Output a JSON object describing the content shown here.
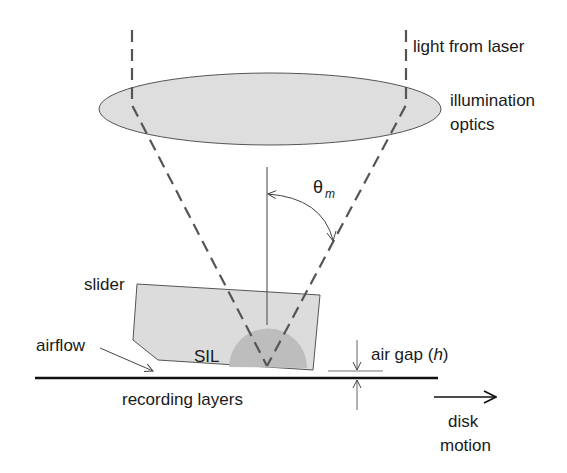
{
  "diagram": {
    "labels": {
      "light_from_laser": "light from laser",
      "illumination_line1": "illumination",
      "illumination_line2": "optics",
      "theta_symbol": "θ",
      "theta_subscript": "m",
      "slider": "slider",
      "sil": "SIL",
      "airflow": "airflow",
      "air_gap_prefix": "air gap (",
      "air_gap_var": "h",
      "air_gap_suffix": ")",
      "recording_layers": "recording layers",
      "disk_line1": "disk",
      "disk_line2": "motion"
    },
    "colors": {
      "lens_fill": "#dedede",
      "slider_fill": "#dcdcdc",
      "sil_fill": "#bdbdbd",
      "beam": "#555555",
      "line": "#444444",
      "disk": "#111111"
    }
  }
}
